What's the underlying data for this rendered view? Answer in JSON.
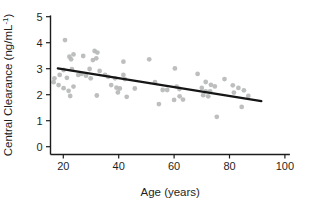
{
  "figure": {
    "background": "#ffffff"
  },
  "chart_data": {
    "type": "scatter",
    "title": "",
    "xlabel": "Age (years)",
    "ylabel": "Central Clearance (ng/mL⁻¹)",
    "ylabel_parts": {
      "main": "Central Clearance (ng/mL",
      "sup": "-1",
      "close": ")"
    },
    "xticks": [
      20,
      40,
      60,
      80,
      100
    ],
    "yticks": [
      0,
      1,
      2,
      3,
      4,
      5
    ],
    "xlim": [
      15.2,
      101.8
    ],
    "ylim": [
      -0.32,
      5.05
    ],
    "grid": false,
    "legend": null,
    "points": [
      [
        20.6,
        4.1
      ],
      [
        22.2,
        3.46
      ],
      [
        23.7,
        3.55
      ],
      [
        22.8,
        3.36
      ],
      [
        27.2,
        3.49
      ],
      [
        31.3,
        3.68
      ],
      [
        32.3,
        3.62
      ],
      [
        30.7,
        3.33
      ],
      [
        31.9,
        3.4
      ],
      [
        20.1,
        2.95
      ],
      [
        23.1,
        2.98
      ],
      [
        29.5,
        2.99
      ],
      [
        33.1,
        2.91
      ],
      [
        18.7,
        2.76
      ],
      [
        16.8,
        2.63
      ],
      [
        16.5,
        2.48
      ],
      [
        21.3,
        2.65
      ],
      [
        25.4,
        2.76
      ],
      [
        26.6,
        2.8
      ],
      [
        28.2,
        2.73
      ],
      [
        29.9,
        2.63
      ],
      [
        18.3,
        2.37
      ],
      [
        20.1,
        2.25
      ],
      [
        21.9,
        2.15
      ],
      [
        23.7,
        2.31
      ],
      [
        22.5,
        1.95
      ],
      [
        32.1,
        1.97
      ],
      [
        35.1,
        2.76
      ],
      [
        36.2,
        2.69
      ],
      [
        38.7,
        2.63
      ],
      [
        41.7,
        3.27
      ],
      [
        41.7,
        2.76
      ],
      [
        42.2,
        2.6
      ],
      [
        37.3,
        2.37
      ],
      [
        39.2,
        2.27
      ],
      [
        40.4,
        2.24
      ],
      [
        39.7,
        2.09
      ],
      [
        42.9,
        1.92
      ],
      [
        45.8,
        2.24
      ],
      [
        51.0,
        3.36
      ],
      [
        60.3,
        3.01
      ],
      [
        53.1,
        2.48
      ],
      [
        55.9,
        2.18
      ],
      [
        57.5,
        2.18
      ],
      [
        60.9,
        2.31
      ],
      [
        61.9,
        2.22
      ],
      [
        54.5,
        1.64
      ],
      [
        60.0,
        1.8
      ],
      [
        62.0,
        1.94
      ],
      [
        63.2,
        1.81
      ],
      [
        68.5,
        2.8
      ],
      [
        71.4,
        2.49
      ],
      [
        73.3,
        2.38
      ],
      [
        70.0,
        2.26
      ],
      [
        74.7,
        2.32
      ],
      [
        71.4,
        2.13
      ],
      [
        73.0,
        2.13
      ],
      [
        70.5,
        1.98
      ],
      [
        72.3,
        1.94
      ],
      [
        78.2,
        2.6
      ],
      [
        81.2,
        2.36
      ],
      [
        83.2,
        2.26
      ],
      [
        85.2,
        2.17
      ],
      [
        81.6,
        2.08
      ],
      [
        86.8,
        1.95
      ],
      [
        84.4,
        1.53
      ],
      [
        75.4,
        1.15
      ]
    ],
    "trend_line": {
      "x1": 18.0,
      "y1": 3.01,
      "x2": 91.5,
      "y2": 1.75
    },
    "colors": {
      "point": "#b4b6b6",
      "trend": "#161616",
      "axis": "#1c1c1c",
      "text": "#1f1f1f"
    }
  }
}
